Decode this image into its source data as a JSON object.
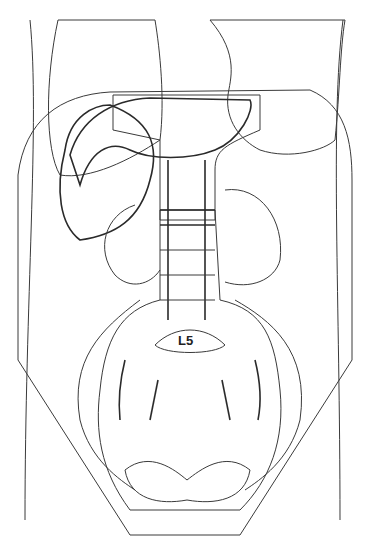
{
  "diagram": {
    "type": "anatomical-radiotherapy-field-diagram",
    "view": "anterior abdomen and pelvis",
    "labels": {
      "vertebra": "L5"
    },
    "regions": [
      {
        "name": "lungs-lower",
        "fill": "dashed-stipple"
      },
      {
        "name": "liver",
        "fill": "fine-dots"
      },
      {
        "name": "spleen",
        "fill": "dense-dots"
      },
      {
        "name": "para-aortic-field",
        "fill": "open-circles"
      },
      {
        "name": "pelvic-field",
        "fill": "open-circles"
      },
      {
        "name": "kidneys",
        "fill": "fine-dots"
      }
    ],
    "colors": {
      "line": "#3a3a3a",
      "background": "#ffffff",
      "pattern": "#8a8a8a"
    }
  }
}
